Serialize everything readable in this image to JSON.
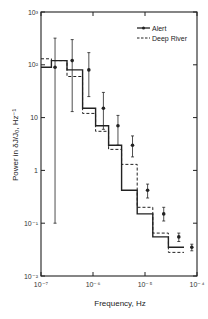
{
  "chart_data": {
    "type": "line",
    "subtype": "step-histogram-with-errorbars",
    "title": "",
    "xlabel": "Frequency, Hz",
    "ylabel": "Power in δJ/J₀, Hz⁻¹",
    "xscale": "log",
    "yscale": "log",
    "xlim": [
      1e-07,
      0.0001
    ],
    "ylim": [
      0.01,
      1000.0
    ],
    "x_ticks": [
      "10⁻⁷",
      "10⁻⁶",
      "10⁻⁵",
      "10⁻⁴"
    ],
    "y_ticks": [
      "10⁻²",
      "10⁻¹",
      "1",
      "10",
      "10²",
      "10³"
    ],
    "grid": false,
    "legend_position": "upper right",
    "bin_edges_log10": [
      -7.0,
      -6.8,
      -6.5,
      -6.2,
      -5.95,
      -5.7,
      -5.45,
      -5.15,
      -4.85,
      -4.55,
      -4.25,
      -4.0
    ],
    "x_centers_log10": [
      -6.73,
      -6.4,
      -6.08,
      -5.8,
      -5.52,
      -5.24,
      -4.95,
      -4.64,
      -4.35,
      -4.1
    ],
    "series": [
      {
        "name": "Alert",
        "style": "solid-with-markers",
        "values": [
          90,
          120,
          80,
          15,
          7,
          3,
          0.42,
          0.15,
          0.055,
          0.035
        ],
        "err_low": [
          0.1,
          13,
          25,
          6,
          3,
          1.8,
          0.3,
          0.11,
          0.045,
          0.03
        ],
        "err_high": [
          320,
          300,
          170,
          30,
          11,
          4.5,
          0.55,
          0.2,
          0.065,
          0.04
        ]
      },
      {
        "name": "Deep River",
        "style": "dashed",
        "values": [
          130,
          120,
          60,
          12,
          5.5,
          2.5,
          1.3,
          0.2,
          0.065,
          0.028
        ]
      }
    ]
  },
  "legend": {
    "items": [
      {
        "label": "Alert"
      },
      {
        "label": "Deep River"
      }
    ]
  },
  "axes": {
    "xlabel": "Frequency, Hz",
    "ylabel": "Power in δJ/J₀, Hz⁻¹",
    "x_ticks": [
      "10⁻⁷",
      "10⁻⁶",
      "10⁻⁵",
      "10⁻⁴"
    ],
    "y_ticks": [
      "10⁻²",
      "10⁻¹",
      "1",
      "10",
      "10²",
      "10³"
    ]
  }
}
